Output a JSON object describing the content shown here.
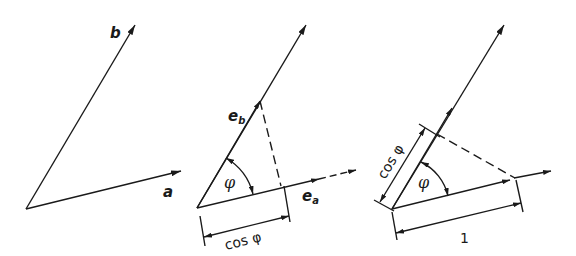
{
  "figure": {
    "panels": [
      {
        "id": "panel-1",
        "labels": {
          "vector_b": "b",
          "vector_a": "a"
        }
      },
      {
        "id": "panel-2",
        "labels": {
          "unit_b": "e",
          "unit_b_sub": "b",
          "unit_a": "e",
          "unit_a_sub": "a",
          "angle": "φ",
          "projection": "cos φ"
        }
      },
      {
        "id": "panel-3",
        "labels": {
          "angle": "φ",
          "projection": "cos φ",
          "unit_length": "1"
        }
      }
    ],
    "colors": {
      "ink": "#1a1a1a",
      "background": "#ffffff"
    }
  }
}
